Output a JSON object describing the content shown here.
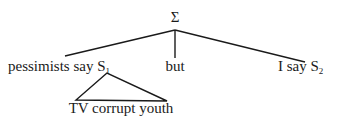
{
  "diagram": {
    "type": "syntax-tree",
    "root": {
      "label": "Σ"
    },
    "children": [
      {
        "label": "pessimists say S",
        "subscript": "1",
        "expansion": {
          "type": "triangle",
          "text": "TV corrupt youth"
        }
      },
      {
        "label": "but"
      },
      {
        "label": "I say S",
        "subscript": "2"
      }
    ]
  }
}
